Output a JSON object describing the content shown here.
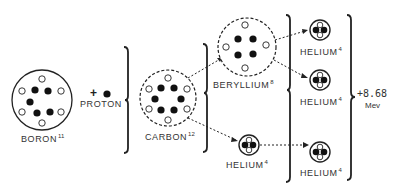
{
  "diagram": {
    "title": "",
    "nuclei": {
      "boron": {
        "name": "BORON",
        "mass": "11",
        "protons": 5,
        "neutrons": 6,
        "outline": "solid"
      },
      "proton": {
        "name": "PROTON",
        "operator": "+"
      },
      "carbon": {
        "name": "CARBON",
        "mass": "12",
        "protons": 6,
        "neutrons": 6,
        "outline": "dashed"
      },
      "beryllium": {
        "name": "BERYLLIUM",
        "mass": "8",
        "protons": 4,
        "neutrons": 4,
        "outline": "dashed"
      },
      "helium_1": {
        "name": "HELIUM",
        "mass": "4",
        "protons": 2,
        "neutrons": 2
      },
      "helium_2": {
        "name": "HELIUM",
        "mass": "4",
        "protons": 2,
        "neutrons": 2
      },
      "helium_3": {
        "name": "HELIUM",
        "mass": "4",
        "protons": 2,
        "neutrons": 2
      },
      "helium_4": {
        "name": "HELIUM",
        "mass": "4",
        "protons": 2,
        "neutrons": 2
      }
    },
    "energy": {
      "value": "+8.68",
      "unit": "Mev"
    },
    "legend": {
      "proton_color": "#111111",
      "neutron_color": "#ffffff"
    }
  }
}
